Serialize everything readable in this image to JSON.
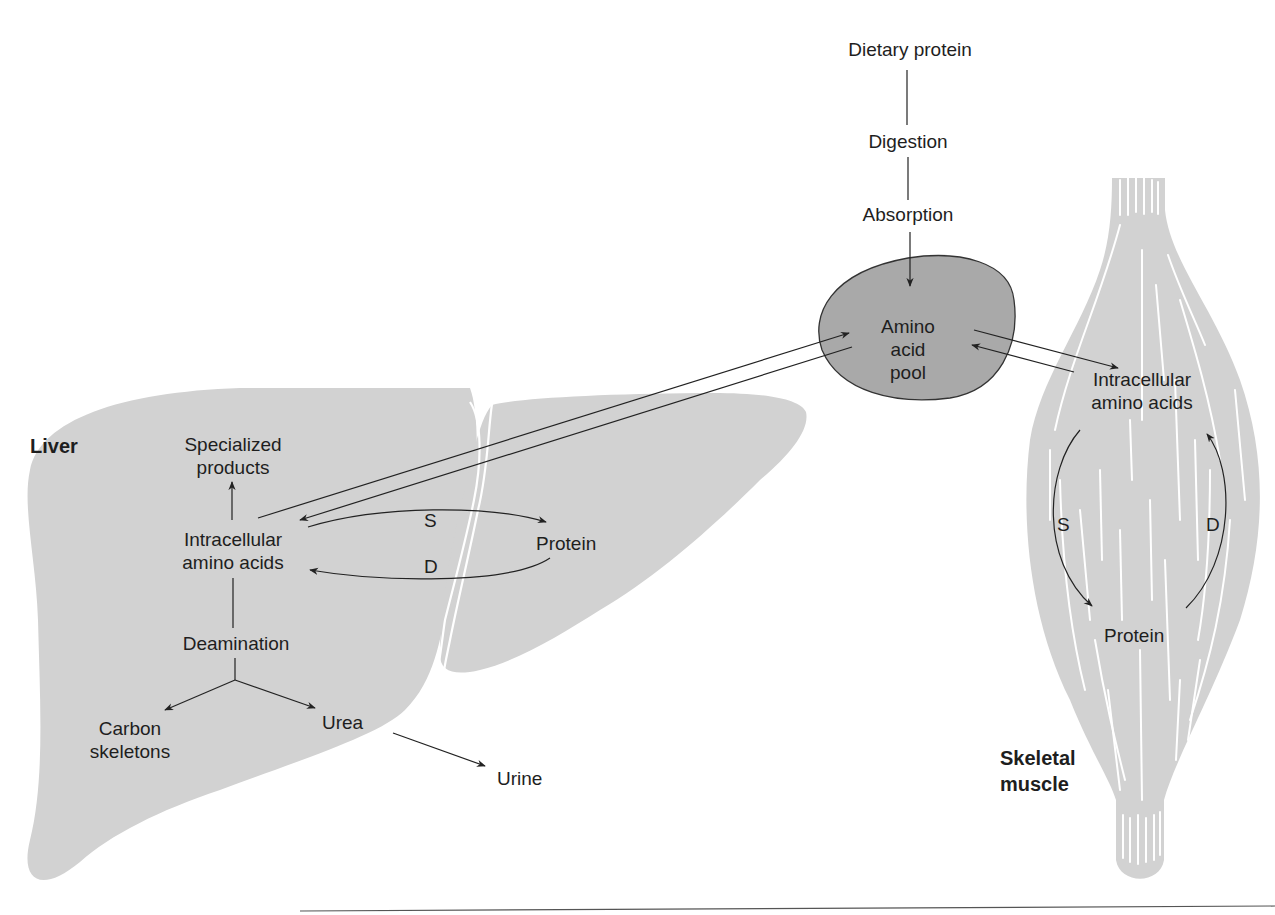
{
  "colors": {
    "organ_fill": "#d2d2d2",
    "pool_fill": "#a9a9a9",
    "line": "#222222",
    "background": "#ffffff"
  },
  "intake": {
    "dietary_protein": "Dietary protein",
    "digestion": "Digestion",
    "absorption": "Absorption"
  },
  "pool": {
    "line1": "Amino",
    "line2": "acid",
    "line3": "pool"
  },
  "liver": {
    "organ_label": "Liver",
    "specialized_line1": "Specialized",
    "specialized_line2": "products",
    "intracellular_line1": "Intracellular",
    "intracellular_line2": "amino acids",
    "synthesis_label": "S",
    "degradation_label": "D",
    "protein": "Protein",
    "deamination": "Deamination",
    "carbon_line1": "Carbon",
    "carbon_line2": "skeletons",
    "urea": "Urea",
    "urine": "Urine"
  },
  "muscle": {
    "organ_label_line1": "Skeletal",
    "organ_label_line2": "muscle",
    "intracellular_line1": "Intracellular",
    "intracellular_line2": "amino acids",
    "synthesis_label": "S",
    "degradation_label": "D",
    "protein": "Protein"
  }
}
